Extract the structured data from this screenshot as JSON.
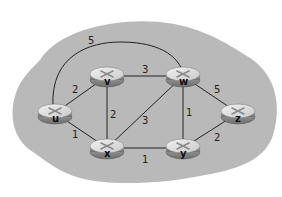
{
  "diagram": {
    "type": "network-graph",
    "background_color": "#ffffff",
    "region_color": "#b9b9b9",
    "edge_color": "#222222",
    "router_color_top": "#e6e6e6",
    "router_color_side": "#8a8a8a",
    "nodes": [
      {
        "id": "u",
        "label": "u",
        "x": 55,
        "y": 113
      },
      {
        "id": "v",
        "label": "v",
        "x": 107,
        "y": 76
      },
      {
        "id": "w",
        "label": "w",
        "x": 183,
        "y": 76
      },
      {
        "id": "x",
        "label": "x",
        "x": 107,
        "y": 148
      },
      {
        "id": "y",
        "label": "y",
        "x": 183,
        "y": 148
      },
      {
        "id": "z",
        "label": "z",
        "x": 238,
        "y": 113
      }
    ],
    "edges": [
      {
        "from": "u",
        "to": "v",
        "weight": "2"
      },
      {
        "from": "u",
        "to": "x",
        "weight": "1"
      },
      {
        "from": "u",
        "to": "w",
        "weight": "5"
      },
      {
        "from": "v",
        "to": "w",
        "weight": "3"
      },
      {
        "from": "v",
        "to": "x",
        "weight": "2"
      },
      {
        "from": "x",
        "to": "w",
        "weight": "3"
      },
      {
        "from": "w",
        "to": "y",
        "weight": "1"
      },
      {
        "from": "w",
        "to": "z",
        "weight": "5"
      },
      {
        "from": "x",
        "to": "y",
        "weight": "1"
      },
      {
        "from": "y",
        "to": "z",
        "weight": "2"
      }
    ]
  }
}
